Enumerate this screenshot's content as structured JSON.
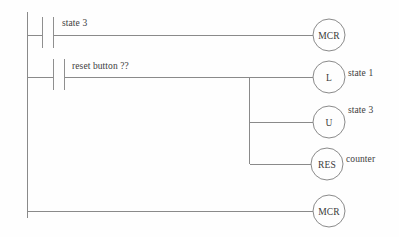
{
  "diagram": {
    "kind": "ladder-logic",
    "colors": {
      "background": "#fefefe",
      "wire": "#8a8a8a",
      "text": "#3d3d3d"
    },
    "rungs": [
      {
        "id": "rung-1",
        "contact": {
          "type": "normally-open",
          "label": "state 3"
        },
        "outputs": [
          {
            "symbol": "MCR",
            "label": ""
          }
        ]
      },
      {
        "id": "rung-2",
        "contact": {
          "type": "normally-open",
          "label": "reset button ??"
        },
        "outputs": [
          {
            "symbol": "L",
            "label": "state 1"
          },
          {
            "symbol": "U",
            "label": "state 3"
          },
          {
            "symbol": "RES",
            "label": "counter"
          }
        ]
      },
      {
        "id": "rung-3",
        "contact": null,
        "outputs": [
          {
            "symbol": "MCR",
            "label": ""
          }
        ]
      }
    ]
  }
}
